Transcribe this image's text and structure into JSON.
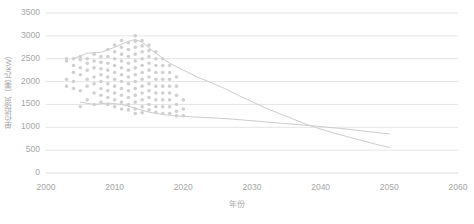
{
  "chart_data": {
    "type": "scatter",
    "title": "",
    "subtitle": "",
    "xlabel": "年份",
    "ylabel": "单位投资（美元/kW）",
    "xlim": [
      2000,
      2060
    ],
    "ylim": [
      0,
      3500
    ],
    "xticks": [
      2000,
      2010,
      2020,
      2030,
      2040,
      2050,
      2060
    ],
    "yticks": [
      0,
      500,
      1000,
      1500,
      2000,
      2500,
      3000,
      3500
    ],
    "xtick_labels": [
      "2000",
      "2010",
      "2020",
      "2030",
      "2040",
      "2050",
      "2060"
    ],
    "ytick_labels": [
      "0",
      "500",
      "1000",
      "1500",
      "2000",
      "2500",
      "3000",
      "3500"
    ],
    "grid": true,
    "grid_axis": "y",
    "grid_color": "#d9d9d9",
    "legend": "none",
    "point_color": "#d0d0d0",
    "point_radius": 1.8,
    "line_color": "#cccccc",
    "line_width": 1.0,
    "series": [
      {
        "name": "散点：历史单位投资",
        "type": "scatter",
        "points": [
          [
            2003,
            2500
          ],
          [
            2003,
            2450
          ],
          [
            2003,
            1900
          ],
          [
            2003,
            2050
          ],
          [
            2004,
            2500
          ],
          [
            2004,
            2350
          ],
          [
            2004,
            2200
          ],
          [
            2004,
            1850
          ],
          [
            2004,
            2000
          ],
          [
            2005,
            2480
          ],
          [
            2005,
            2300
          ],
          [
            2005,
            2150
          ],
          [
            2005,
            1800
          ],
          [
            2005,
            2550
          ],
          [
            2005,
            1450
          ],
          [
            2006,
            2500
          ],
          [
            2006,
            2400
          ],
          [
            2006,
            2250
          ],
          [
            2006,
            2050
          ],
          [
            2006,
            1900
          ],
          [
            2006,
            1600
          ],
          [
            2007,
            2600
          ],
          [
            2007,
            2450
          ],
          [
            2007,
            2300
          ],
          [
            2007,
            2100
          ],
          [
            2007,
            1950
          ],
          [
            2007,
            1750
          ],
          [
            2007,
            1500
          ],
          [
            2008,
            2550
          ],
          [
            2008,
            2420
          ],
          [
            2008,
            2280
          ],
          [
            2008,
            2150
          ],
          [
            2008,
            2000
          ],
          [
            2008,
            1850
          ],
          [
            2008,
            1700
          ],
          [
            2008,
            1550
          ],
          [
            2009,
            2700
          ],
          [
            2009,
            2550
          ],
          [
            2009,
            2400
          ],
          [
            2009,
            2250
          ],
          [
            2009,
            2100
          ],
          [
            2009,
            1950
          ],
          [
            2009,
            1800
          ],
          [
            2009,
            1650
          ],
          [
            2009,
            1500
          ],
          [
            2010,
            2800
          ],
          [
            2010,
            2650
          ],
          [
            2010,
            2500
          ],
          [
            2010,
            2350
          ],
          [
            2010,
            2200
          ],
          [
            2010,
            2050
          ],
          [
            2010,
            1900
          ],
          [
            2010,
            1750
          ],
          [
            2010,
            1600
          ],
          [
            2010,
            1450
          ],
          [
            2011,
            2900
          ],
          [
            2011,
            2750
          ],
          [
            2011,
            2600
          ],
          [
            2011,
            2450
          ],
          [
            2011,
            2300
          ],
          [
            2011,
            2150
          ],
          [
            2011,
            2000
          ],
          [
            2011,
            1850
          ],
          [
            2011,
            1700
          ],
          [
            2011,
            1550
          ],
          [
            2011,
            1400
          ],
          [
            2012,
            2850
          ],
          [
            2012,
            2700
          ],
          [
            2012,
            2550
          ],
          [
            2012,
            2400
          ],
          [
            2012,
            2250
          ],
          [
            2012,
            2100
          ],
          [
            2012,
            1950
          ],
          [
            2012,
            1800
          ],
          [
            2012,
            1650
          ],
          [
            2012,
            1500
          ],
          [
            2012,
            1380
          ],
          [
            2013,
            3000
          ],
          [
            2013,
            2880
          ],
          [
            2013,
            2750
          ],
          [
            2013,
            2600
          ],
          [
            2013,
            2450
          ],
          [
            2013,
            2300
          ],
          [
            2013,
            2150
          ],
          [
            2013,
            2000
          ],
          [
            2013,
            1850
          ],
          [
            2013,
            1700
          ],
          [
            2013,
            1550
          ],
          [
            2013,
            1400
          ],
          [
            2013,
            1300
          ],
          [
            2014,
            2900
          ],
          [
            2014,
            2780
          ],
          [
            2014,
            2650
          ],
          [
            2014,
            2500
          ],
          [
            2014,
            2350
          ],
          [
            2014,
            2200
          ],
          [
            2014,
            2050
          ],
          [
            2014,
            1900
          ],
          [
            2014,
            1750
          ],
          [
            2014,
            1600
          ],
          [
            2014,
            1450
          ],
          [
            2014,
            1320
          ],
          [
            2015,
            2800
          ],
          [
            2015,
            2680
          ],
          [
            2015,
            2550
          ],
          [
            2015,
            2400
          ],
          [
            2015,
            2250
          ],
          [
            2015,
            2100
          ],
          [
            2015,
            1950
          ],
          [
            2015,
            1800
          ],
          [
            2015,
            1650
          ],
          [
            2015,
            1500
          ],
          [
            2015,
            1380
          ],
          [
            2016,
            2650
          ],
          [
            2016,
            2500
          ],
          [
            2016,
            2350
          ],
          [
            2016,
            2200
          ],
          [
            2016,
            2050
          ],
          [
            2016,
            1900
          ],
          [
            2016,
            1750
          ],
          [
            2016,
            1600
          ],
          [
            2016,
            1450
          ],
          [
            2016,
            1330
          ],
          [
            2017,
            2500
          ],
          [
            2017,
            2350
          ],
          [
            2017,
            2200
          ],
          [
            2017,
            2050
          ],
          [
            2017,
            1900
          ],
          [
            2017,
            1750
          ],
          [
            2017,
            1600
          ],
          [
            2017,
            1450
          ],
          [
            2017,
            1300
          ],
          [
            2018,
            2350
          ],
          [
            2018,
            2200
          ],
          [
            2018,
            2050
          ],
          [
            2018,
            1900
          ],
          [
            2018,
            1750
          ],
          [
            2018,
            1600
          ],
          [
            2018,
            1450
          ],
          [
            2018,
            1300
          ],
          [
            2019,
            2100
          ],
          [
            2019,
            1900
          ],
          [
            2019,
            1700
          ],
          [
            2019,
            1500
          ],
          [
            2019,
            1350
          ],
          [
            2019,
            1250
          ],
          [
            2020,
            1600
          ],
          [
            2020,
            1400
          ],
          [
            2020,
            1250
          ]
        ]
      },
      {
        "name": "趋势线一（上）",
        "type": "line",
        "points": [
          [
            2004,
            2500
          ],
          [
            2006,
            2620
          ],
          [
            2008,
            2640
          ],
          [
            2010,
            2750
          ],
          [
            2012,
            2880
          ],
          [
            2013,
            2920
          ],
          [
            2014,
            2860
          ],
          [
            2016,
            2620
          ],
          [
            2018,
            2400
          ],
          [
            2020,
            2250
          ],
          [
            2022,
            2100
          ],
          [
            2024,
            1980
          ],
          [
            2026,
            1850
          ],
          [
            2028,
            1700
          ],
          [
            2030,
            1560
          ],
          [
            2032,
            1420
          ],
          [
            2034,
            1300
          ],
          [
            2036,
            1180
          ],
          [
            2038,
            1060
          ],
          [
            2040,
            960
          ],
          [
            2042,
            870
          ],
          [
            2044,
            790
          ],
          [
            2046,
            710
          ],
          [
            2048,
            630
          ],
          [
            2050,
            560
          ]
        ]
      },
      {
        "name": "趋势线二（下）",
        "type": "line",
        "points": [
          [
            2005,
            1550
          ],
          [
            2007,
            1500
          ],
          [
            2009,
            1530
          ],
          [
            2011,
            1500
          ],
          [
            2013,
            1420
          ],
          [
            2015,
            1330
          ],
          [
            2017,
            1280
          ],
          [
            2019,
            1250
          ],
          [
            2021,
            1230
          ],
          [
            2023,
            1215
          ],
          [
            2025,
            1200
          ],
          [
            2027,
            1180
          ],
          [
            2029,
            1155
          ],
          [
            2031,
            1130
          ],
          [
            2033,
            1105
          ],
          [
            2035,
            1080
          ],
          [
            2037,
            1055
          ],
          [
            2039,
            1030
          ],
          [
            2041,
            1000
          ],
          [
            2043,
            975
          ],
          [
            2045,
            940
          ],
          [
            2047,
            905
          ],
          [
            2049,
            870
          ],
          [
            2050,
            855
          ]
        ]
      }
    ]
  },
  "axes": {
    "plot_left": 46,
    "plot_right": 458,
    "plot_top": 13,
    "plot_bottom": 173
  }
}
